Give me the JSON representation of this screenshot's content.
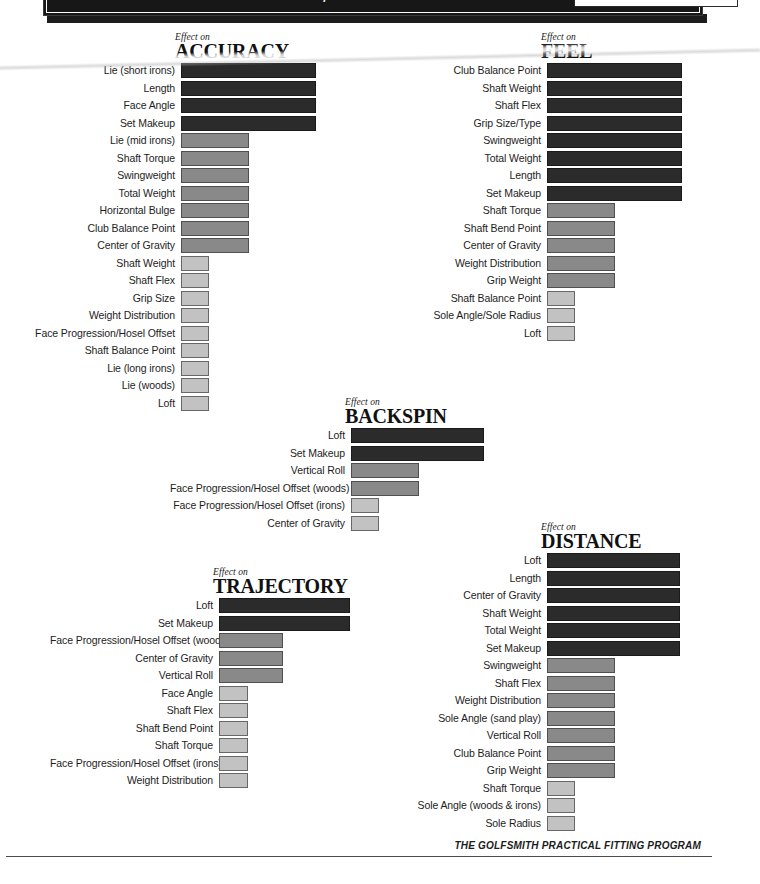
{
  "header": {
    "title": "Effects of Golf Club Specifications on Shot Performance"
  },
  "footer": {
    "text": "THE GOLFSMITH PRACTICAL FITTING PROGRAM"
  },
  "legend": {
    "high_color": "#2b2b2b",
    "medium_color": "#898989",
    "low_color": "#c2c2c2"
  },
  "chart_data": [
    {
      "id": "accuracy",
      "type": "bar",
      "orientation": "horizontal",
      "eyebrow": "Effect on",
      "title": "ACCURACY",
      "xlabel": "",
      "ylabel": "",
      "grid": false,
      "legend": "none",
      "xlim": [
        0,
        3
      ],
      "categories": [
        "Lie (short irons)",
        "Length",
        "Face Angle",
        "Set Makeup",
        "Lie (mid irons)",
        "Shaft Torque",
        "Swingweight",
        "Total Weight",
        "Horizontal Bulge",
        "Club Balance Point",
        "Center of Gravity",
        "Shaft Weight",
        "Shaft Flex",
        "Grip Size",
        "Weight Distribution",
        "Face Progression/Hosel Offset",
        "Shaft Balance Point",
        "Lie (long irons)",
        "Lie (woods)",
        "Loft"
      ],
      "values": [
        3,
        3,
        3,
        3,
        2,
        2,
        2,
        2,
        2,
        2,
        2,
        1,
        1,
        1,
        1,
        1,
        1,
        1,
        1,
        1
      ],
      "levels": [
        "high",
        "high",
        "high",
        "high",
        "medium",
        "medium",
        "medium",
        "medium",
        "medium",
        "medium",
        "medium",
        "low",
        "low",
        "low",
        "low",
        "low",
        "low",
        "low",
        "low",
        "low"
      ]
    },
    {
      "id": "feel",
      "type": "bar",
      "orientation": "horizontal",
      "eyebrow": "Effect on",
      "title": "FEEL",
      "xlabel": "",
      "ylabel": "",
      "grid": false,
      "legend": "none",
      "xlim": [
        0,
        3
      ],
      "categories": [
        "Club Balance Point",
        "Shaft Weight",
        "Shaft Flex",
        "Grip Size/Type",
        "Swingweight",
        "Total Weight",
        "Length",
        "Set Makeup",
        "Shaft Torque",
        "Shaft Bend Point",
        "Center of Gravity",
        "Weight Distribution",
        "Grip Weight",
        "Shaft Balance Point",
        "Sole Angle/Sole Radius",
        "Loft"
      ],
      "values": [
        3,
        3,
        3,
        3,
        3,
        3,
        3,
        3,
        2,
        2,
        2,
        2,
        2,
        1,
        1,
        1
      ],
      "levels": [
        "high",
        "high",
        "high",
        "high",
        "high",
        "high",
        "high",
        "high",
        "medium",
        "medium",
        "medium",
        "medium",
        "medium",
        "low",
        "low",
        "low"
      ]
    },
    {
      "id": "backspin",
      "type": "bar",
      "orientation": "horizontal",
      "eyebrow": "Effect on",
      "title": "BACKSPIN",
      "xlabel": "",
      "ylabel": "",
      "grid": false,
      "legend": "none",
      "xlim": [
        0,
        3
      ],
      "categories": [
        "Loft",
        "Set Makeup",
        "Vertical Roll",
        "Face Progression/Hosel Offset (woods)",
        "Face Progression/Hosel Offset (irons)",
        "Center of Gravity"
      ],
      "values": [
        3,
        3,
        2,
        2,
        1,
        1
      ],
      "levels": [
        "high",
        "high",
        "medium",
        "medium",
        "low",
        "low"
      ]
    },
    {
      "id": "trajectory",
      "type": "bar",
      "orientation": "horizontal",
      "eyebrow": "Effect on",
      "title": "TRAJECTORY",
      "xlabel": "",
      "ylabel": "",
      "grid": false,
      "legend": "none",
      "xlim": [
        0,
        3
      ],
      "categories": [
        "Loft",
        "Set Makeup",
        "Face Progression/Hosel Offset (woods)",
        "Center of Gravity",
        "Vertical Roll",
        "Face Angle",
        "Shaft Flex",
        "Shaft Bend Point",
        "Shaft Torque",
        "Face Progression/Hosel Offset (irons)",
        "Weight Distribution"
      ],
      "values": [
        3,
        3,
        2,
        2,
        2,
        1,
        1,
        1,
        1,
        1,
        1
      ],
      "levels": [
        "high",
        "high",
        "medium",
        "medium",
        "medium",
        "low",
        "low",
        "low",
        "low",
        "low",
        "low"
      ]
    },
    {
      "id": "distance",
      "type": "bar",
      "orientation": "horizontal",
      "eyebrow": "Effect on",
      "title": "DISTANCE",
      "xlabel": "",
      "ylabel": "",
      "grid": false,
      "legend": "none",
      "xlim": [
        0,
        3
      ],
      "categories": [
        "Loft",
        "Length",
        "Center of Gravity",
        "Shaft Weight",
        "Total Weight",
        "Set Makeup",
        "Swingweight",
        "Shaft Flex",
        "Weight Distribution",
        "Sole Angle (sand play)",
        "Vertical Roll",
        "Club Balance Point",
        "Grip Weight",
        "Shaft Torque",
        "Sole Angle (woods & irons)",
        "Sole Radius"
      ],
      "values": [
        3,
        3,
        3,
        3,
        3,
        3,
        2,
        2,
        2,
        2,
        2,
        2,
        2,
        1,
        1,
        1
      ],
      "levels": [
        "high",
        "high",
        "high",
        "high",
        "high",
        "high",
        "medium",
        "medium",
        "medium",
        "medium",
        "medium",
        "medium",
        "medium",
        "low",
        "low",
        "low"
      ]
    }
  ]
}
